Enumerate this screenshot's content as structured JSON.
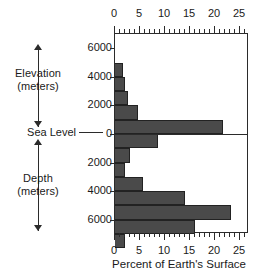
{
  "labels": {
    "elevation": "Elevation",
    "elevation_units": "(meters)",
    "depth": "Depth",
    "depth_units": "(meters)",
    "sea_level": "Sea Level"
  },
  "chart_data": {
    "type": "bar",
    "orientation": "horizontal",
    "title": "",
    "xlabel": "Percent of Earth's Surface",
    "ylabel": "Elevation / Depth (meters)",
    "xlim": [
      0,
      26.8
    ],
    "ylim": [
      -7000,
      7000
    ],
    "grid": false,
    "legend": null,
    "xticks": [
      0,
      5,
      10,
      15,
      20,
      25
    ],
    "xtick_labels": [
      "0",
      "5",
      "10",
      "15",
      "20",
      "25"
    ],
    "xtick_minor_step": 1,
    "yticks": [
      6000,
      4000,
      2000,
      0,
      -2000,
      -4000,
      -6000
    ],
    "ytick_labels": [
      "6000",
      "4000",
      "2000",
      "0",
      "2000",
      "4000",
      "6000"
    ],
    "bin_width": 1000,
    "bar_color": "#4a4a4a",
    "bar_edge_color": "#222222",
    "axis_color": "#2b2b2b",
    "categories": [
      "6000 to 7000 m elevation",
      "5000 to 6000 m elevation",
      "4000 to 5000 m elevation",
      "3000 to 4000 m elevation",
      "2000 to 3000 m elevation",
      "1000 to 2000 m elevation",
      "0 to 1000 m elevation",
      "0 to 1000 m depth",
      "1000 to 2000 m depth",
      "2000 to 3000 m depth",
      "3000 to 4000 m depth",
      "4000 to 5000 m depth",
      "5000 to 6000 m depth",
      "6000 to 7000 m depth",
      "7000 to 8000 m depth"
    ],
    "bins": [
      {
        "top": 7000,
        "bottom": 6000,
        "value": 0.0
      },
      {
        "top": 6000,
        "bottom": 5000,
        "value": 0.0
      },
      {
        "top": 5000,
        "bottom": 4000,
        "value": 1.5
      },
      {
        "top": 4000,
        "bottom": 3000,
        "value": 2.0
      },
      {
        "top": 3000,
        "bottom": 2000,
        "value": 2.6
      },
      {
        "top": 2000,
        "bottom": 1000,
        "value": 4.6
      },
      {
        "top": 1000,
        "bottom": 0,
        "value": 21.5
      },
      {
        "top": 0,
        "bottom": -1000,
        "value": 8.5
      },
      {
        "top": -1000,
        "bottom": -2000,
        "value": 3.0
      },
      {
        "top": -2000,
        "bottom": -3000,
        "value": 2.0
      },
      {
        "top": -3000,
        "bottom": -4000,
        "value": 5.6
      },
      {
        "top": -4000,
        "bottom": -5000,
        "value": 14.0
      },
      {
        "top": -5000,
        "bottom": -6000,
        "value": 23.2
      },
      {
        "top": -6000,
        "bottom": -7000,
        "value": 16.0
      },
      {
        "top": -7000,
        "bottom": -8000,
        "value": 2.0
      }
    ],
    "values": [
      0.0,
      0.0,
      1.5,
      2.0,
      2.6,
      4.6,
      21.5,
      8.5,
      3.0,
      2.0,
      5.6,
      14.0,
      23.2,
      16.0,
      2.0
    ]
  }
}
